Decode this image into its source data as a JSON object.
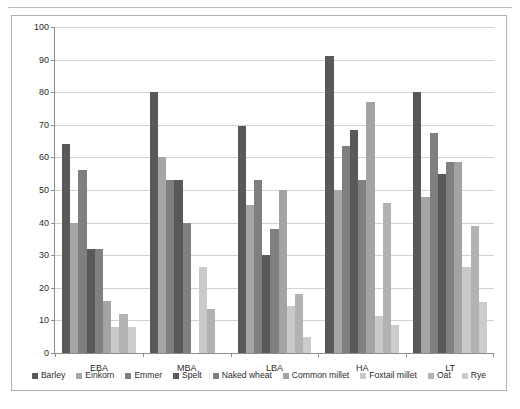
{
  "chart_data": {
    "type": "bar",
    "title": "",
    "subtitle": "",
    "xlabel": "",
    "ylabel": "",
    "ylim": [
      0,
      100
    ],
    "ytick_step": 10,
    "yticks": [
      0,
      10,
      20,
      30,
      40,
      50,
      60,
      70,
      80,
      90,
      100
    ],
    "grid": true,
    "grid_axis": "y",
    "legend_position": "bottom",
    "categories": [
      "EBA",
      "MBA",
      "LBA",
      "HA",
      "LT"
    ],
    "series": [
      {
        "name": "Barley",
        "color": "#595959",
        "values": [
          64,
          80,
          69.5,
          91,
          80
        ]
      },
      {
        "name": "Einkorn",
        "color": "#a6a6a6",
        "values": [
          40,
          60,
          45.5,
          50,
          48
        ]
      },
      {
        "name": "Emmer",
        "color": "#7f7f7f",
        "values": [
          56,
          53,
          53,
          63.5,
          67.5
        ]
      },
      {
        "name": "Spelt",
        "color": "#595959",
        "values": [
          32,
          53,
          30,
          68.5,
          55
        ]
      },
      {
        "name": "Naked wheat",
        "color": "#808080",
        "values": [
          32,
          40,
          38,
          53,
          58.5
        ]
      },
      {
        "name": "Common millet",
        "color": "#a3a3a3",
        "values": [
          16,
          0,
          50,
          77,
          58.5
        ]
      },
      {
        "name": "Foxtail millet",
        "color": "#c9c9c9",
        "values": [
          8,
          26.5,
          14.5,
          11.5,
          26.5
        ]
      },
      {
        "name": "Oat",
        "color": "#b3b3b3",
        "values": [
          12,
          13.5,
          18,
          46,
          39
        ]
      },
      {
        "name": "Rye",
        "color": "#cccccc",
        "values": [
          8,
          0,
          5,
          8.5,
          15.5
        ]
      }
    ]
  },
  "colors": {
    "frame_border": "#b0b0b0",
    "axis": "#8d8d8d",
    "gridline": "#d2d2d2",
    "text": "#2b2b2b",
    "background": "#ffffff",
    "top_rule": "#b9b9b9"
  }
}
